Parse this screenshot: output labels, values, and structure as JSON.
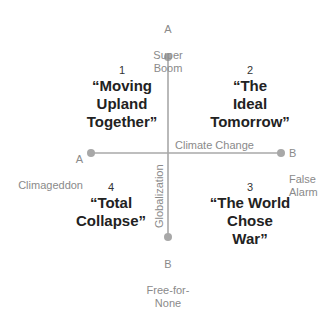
{
  "diagram": {
    "type": "scenario-matrix",
    "colors": {
      "axis": "#a8a8a8",
      "label": "#8a8a8a",
      "title": "#222222"
    },
    "horizontal_axis": {
      "name": "Climate Change",
      "left_end": {
        "letter": "A",
        "label": "Climageddon"
      },
      "right_end": {
        "letter": "B",
        "label": "False\nAlarm"
      }
    },
    "vertical_axis": {
      "name": "Globalization",
      "top_end": {
        "letter": "A",
        "label": "Super\nBoom"
      },
      "bottom_end": {
        "letter": "B",
        "label": "Free-for-\nNone"
      }
    },
    "quadrants": [
      {
        "number": "1",
        "title": "“Moving\nUpland\nTogether”"
      },
      {
        "number": "2",
        "title": "“The\nIdeal\nTomorrow”"
      },
      {
        "number": "3",
        "title": "“The World\nChose\nWar”"
      },
      {
        "number": "4",
        "title": "“Total\nCollapse”"
      }
    ]
  }
}
